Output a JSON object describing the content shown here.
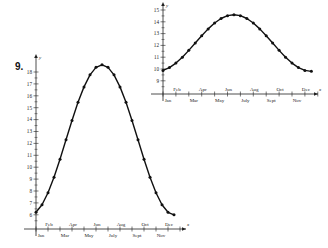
{
  "problem_number": "9.",
  "chart_data": [
    {
      "type": "line",
      "title": "",
      "xlabel": "x",
      "ylabel": "y",
      "ylim": [
        8.5,
        15.5
      ],
      "yticks": [
        9,
        10,
        11,
        12,
        13,
        14,
        15
      ],
      "month_labels_upper": [
        "Feb",
        "Apr",
        "Jun",
        "Aug",
        "Oct",
        "Dec"
      ],
      "month_labels_lower": [
        "Jan",
        "Mar",
        "May",
        "July",
        "Sept",
        "Nov"
      ],
      "x": [
        0,
        0.5,
        1,
        1.5,
        2,
        2.5,
        3,
        3.5,
        4,
        4.5,
        5,
        5.5,
        6,
        6.5,
        7,
        7.5,
        8,
        8.5,
        9,
        9.5,
        10,
        10.5,
        11,
        11.5
      ],
      "values": [
        9.88,
        10.12,
        10.5,
        11.0,
        11.58,
        12.2,
        12.82,
        13.4,
        13.9,
        14.28,
        14.52,
        14.6,
        14.52,
        14.28,
        13.9,
        13.4,
        12.82,
        12.2,
        11.58,
        11.0,
        10.5,
        10.12,
        9.88,
        9.8
      ],
      "grid": false,
      "position": "top-right"
    },
    {
      "type": "line",
      "title": "",
      "xlabel": "x",
      "ylabel": "y",
      "ylim": [
        5.5,
        19
      ],
      "yticks": [
        6,
        7,
        8,
        9,
        10,
        11,
        12,
        13,
        14,
        15,
        16,
        17,
        18
      ],
      "month_labels_upper": [
        "Feb",
        "Apr",
        "Jun",
        "Aug",
        "Oct",
        "Dec"
      ],
      "month_labels_lower": [
        "Jan",
        "Mar",
        "May",
        "July",
        "Sept",
        "Nov"
      ],
      "x": [
        0,
        0.5,
        1,
        1.5,
        2,
        2.5,
        3,
        3.5,
        4,
        4.5,
        5,
        5.5,
        6,
        6.5,
        7,
        7.5,
        8,
        8.5,
        9,
        9.5,
        10,
        10.5,
        11,
        11.5
      ],
      "values": [
        6.21,
        6.84,
        7.85,
        9.15,
        10.67,
        12.3,
        13.93,
        15.45,
        16.75,
        17.76,
        18.39,
        18.6,
        18.39,
        17.76,
        16.75,
        15.45,
        13.93,
        12.3,
        10.67,
        9.15,
        7.85,
        6.84,
        6.21,
        6.0
      ],
      "grid": false,
      "position": "bottom-left"
    }
  ]
}
